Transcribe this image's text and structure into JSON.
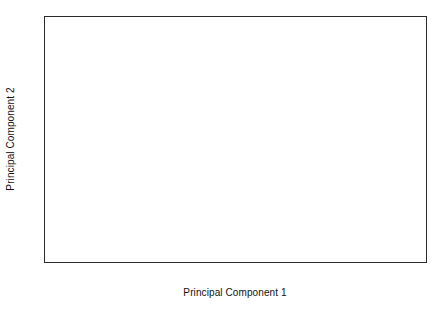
{
  "chart_data": {
    "type": "scatter",
    "title": "",
    "xlabel": "Principal Component 1",
    "ylabel": "Principal Component 2",
    "xlim": [
      -4,
      4
    ],
    "ylim": [
      -3,
      4
    ],
    "xticks": [
      -4,
      -3,
      -2,
      -1,
      0,
      1,
      2,
      3,
      4
    ],
    "yticks": [
      -3,
      -2,
      -1,
      0,
      1,
      2,
      3,
      4
    ],
    "xtick_labels": [
      "-4",
      "-3",
      "-2",
      "-1",
      "0",
      "1",
      "2",
      "3",
      "4"
    ],
    "ytick_labels": [
      "-3",
      "-2",
      "-1",
      "0",
      "1",
      "2",
      "3",
      "4"
    ],
    "grid": false,
    "legend": null,
    "reference_lines": [
      {
        "axis": "x",
        "value": 0
      },
      {
        "axis": "y",
        "value": 0
      }
    ],
    "marker": "open-circle",
    "marker_size": 3.2,
    "n_points": 33,
    "points": [
      {
        "x": -3.48,
        "y": -0.47
      },
      {
        "x": -2.8,
        "y": -0.44
      },
      {
        "x": -2.52,
        "y": 0.23
      },
      {
        "x": -2.42,
        "y": -0.95
      },
      {
        "x": -2.04,
        "y": -0.86
      },
      {
        "x": -1.99,
        "y": -0.52
      },
      {
        "x": -1.9,
        "y": -0.5
      },
      {
        "x": -1.88,
        "y": -0.39
      },
      {
        "x": -1.84,
        "y": -0.07
      },
      {
        "x": -1.58,
        "y": -1.72
      },
      {
        "x": -1.39,
        "y": -0.58
      },
      {
        "x": -1.26,
        "y": 1.8
      },
      {
        "x": -1.22,
        "y": 1.76
      },
      {
        "x": -1.2,
        "y": 1.73
      },
      {
        "x": -1.12,
        "y": 1.45
      },
      {
        "x": -0.95,
        "y": -1.15
      },
      {
        "x": -0.86,
        "y": 0.81
      },
      {
        "x": -0.55,
        "y": 1.63
      },
      {
        "x": -0.5,
        "y": 0.73
      },
      {
        "x": -0.32,
        "y": 2.36
      },
      {
        "x": -0.17,
        "y": 1.39
      },
      {
        "x": 1.27,
        "y": -1.17
      },
      {
        "x": 1.43,
        "y": -2.31
      },
      {
        "x": 1.86,
        "y": -1.2
      },
      {
        "x": 2.14,
        "y": -2.33
      },
      {
        "x": 2.48,
        "y": -0.77
      },
      {
        "x": 2.49,
        "y": -1.11
      },
      {
        "x": 2.54,
        "y": -3.0
      },
      {
        "x": 2.71,
        "y": 0.11
      },
      {
        "x": 2.78,
        "y": 2.8
      },
      {
        "x": 2.84,
        "y": 2.77
      },
      {
        "x": 2.9,
        "y": -1.89
      },
      {
        "x": 3.15,
        "y": 3.02
      }
    ]
  }
}
